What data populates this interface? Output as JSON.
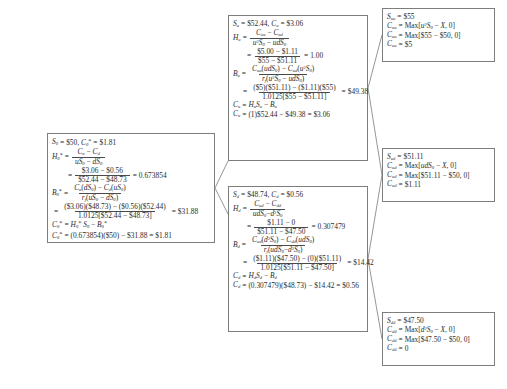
{
  "diagram": {
    "type": "binomial-tree",
    "parameters": {
      "S0": "$50",
      "u_S0": "$52.44",
      "d_S0": "$48.73",
      "uu_S0": "$55",
      "ud_S0": "$51.11",
      "dd_S0": "$47.50",
      "strike_X": "$50",
      "risk_free_factor": "1.0125",
      "C0": "$1.81",
      "Cu": "$3.06",
      "Cd": "$0.56",
      "Cuu": "$5",
      "Cud": "$1.11",
      "Cdd": "0",
      "H0": "0.673854",
      "Hu": "1.00",
      "Hd": "0.307479",
      "B0": "$31.88",
      "Bu": "$49.38",
      "Bd": "$14.42"
    }
  },
  "nodes": {
    "root": {
      "name": "root-node",
      "header_S": "S",
      "header_S_sub": "0",
      "header_S_val": "$50",
      "header_C": "C",
      "header_C_sub": "0",
      "header_C_val": "$1.81",
      "H_sym": "H",
      "H_sub": "0",
      "H_num": "C_u − C_d",
      "H_den": "uS_0 − dS_0",
      "H_num2": "$3.06 − $0.56",
      "H_den2": "$52.44 − $48.73",
      "H_val": "0.673854",
      "B_sym": "B",
      "B_sub": "0",
      "B_num": "C_u(dS_0) − C_d(uS_0)",
      "B_den": "r_f(uS_0 − dS_0)",
      "B_num2": "($3.06)($48.73) − ($0.56)($52.44)",
      "B_den2": "1.0125[$52.44 − $48.73]",
      "B_val": "$31.88",
      "C_formula": "H_0 S_0 − B_0",
      "C_calc": "(0.673854)($50) − $31.88 = $1.81"
    },
    "up": {
      "name": "up-node",
      "header_S_val": "$52.44",
      "header_C_val": "$3.06",
      "H_num": "C_uu − C_ud",
      "H_den": "u²S_0 − udS_0",
      "H_num2": "$5.00 − $1.11",
      "H_den2": "$55 − $51.11",
      "H_val": "1.00",
      "B_num": "C_uu(udS_0) − C_ud(u²S_0)",
      "B_den": "r_f(u²S_0 − udS_0)",
      "B_num2": "($5)($51.11) − ($1.11)($55)",
      "B_den2": "1.0125[$55 − $51.11]",
      "B_val": "$49.38",
      "C_formula": "H_u S_u − B_u",
      "C_calc": "(1)$52.44 − $49.38 = $3.06"
    },
    "down": {
      "name": "down-node",
      "header_S_val": "$48.74",
      "header_C_val": "$0.56",
      "H_num": "C_ud − C_dd",
      "H_den": "udS_0 − d²S_0",
      "H_num2": "$1.11 − 0",
      "H_den2": "$51.11 − $47.50",
      "H_val": "0.307479",
      "B_num": "C_ud(d²S_0) − C_dd(udS_0)",
      "B_den": "r_f(udS_0 − d²S_0)",
      "B_num2": "($1.11)($47.50) − (0)($51.11)",
      "B_den2": "1.0125[$51.11 − $47.50]",
      "B_val": "$14.42",
      "C_formula": "H_d S_d − B_d",
      "C_calc": "(0.307479)($48.73) − $14.42 = $0.56"
    },
    "uu": {
      "name": "uu-terminal-node",
      "S_val": "$55",
      "C_generic": "Max[u²S_0 − X, 0]",
      "C_numeric": "Max[$55 − $50, 0]",
      "C_val": "$5"
    },
    "ud": {
      "name": "ud-terminal-node",
      "S_val": "$51.11",
      "C_generic": "Max[udS_0 − X, 0]",
      "C_numeric": "Max[$51.11 − $50, 0]",
      "C_val": "$1.11"
    },
    "dd": {
      "name": "dd-terminal-node",
      "S_val": "$47.50",
      "C_generic": "Max[d²S_0 − X, 0]",
      "C_numeric": "Max[$47.50 − $50, 0]",
      "C_val": "0"
    }
  },
  "symbols": {
    "equals": "=",
    "S": "S",
    "C": "C",
    "H": "H",
    "B": "B",
    "prime": "*",
    "sub_0": "0",
    "sub_u": "u",
    "sub_d": "d",
    "sub_uu": "uu",
    "sub_ud": "ud",
    "sub_dd": "dd"
  },
  "colors": {
    "border": "#7d7d7d",
    "text": "#2b2b2b",
    "background": "#ffffff",
    "connector": "#8a8a8a"
  }
}
